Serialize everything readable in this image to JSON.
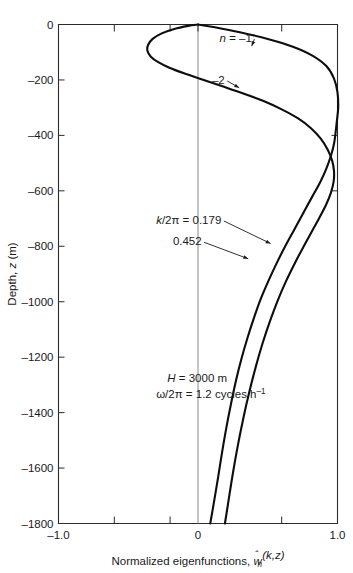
{
  "figure": {
    "background_color": "#ffffff",
    "curve_color": "#0d0d0d",
    "axis_color": "#2b2b2b",
    "zero_line_color": "#8a8a8a"
  },
  "chart_data": {
    "type": "line",
    "title": "",
    "xlabel": "Normalized eigenfunctions, ŵₙ(k,z)",
    "ylabel": "Depth, z (m)",
    "xlim": [
      -1.0,
      1.0
    ],
    "ylim": [
      -1800,
      0
    ],
    "grid": false,
    "legend_position": "inline-annotations",
    "xticks": [
      -1.0,
      -0.6,
      -0.2,
      0,
      0.6,
      1.0
    ],
    "xtick_labels": [
      "-1.0",
      "",
      "",
      "0",
      "",
      "1.0"
    ],
    "yticks": [
      0,
      -200,
      -400,
      -600,
      -800,
      -1000,
      -1200,
      -1400,
      -1600,
      -1800
    ],
    "ytick_labels": [
      "0",
      "-200",
      "-400",
      "-600",
      "-800",
      "-1000",
      "-1200",
      "-1400",
      "-1600",
      "-1800"
    ],
    "series": [
      {
        "name": "n = -1",
        "label": "n = -1",
        "label_italic_part": "n",
        "k_over_2pi": 0.179,
        "points": [
          [
            0.0,
            0
          ],
          [
            0.12,
            -10
          ],
          [
            0.3,
            -28
          ],
          [
            0.5,
            -52
          ],
          [
            0.68,
            -80
          ],
          [
            0.82,
            -112
          ],
          [
            0.92,
            -150
          ],
          [
            0.975,
            -195
          ],
          [
            1.0,
            -245
          ],
          [
            1.005,
            -300
          ],
          [
            0.995,
            -350
          ],
          [
            0.985,
            -395
          ],
          [
            0.975,
            -430
          ],
          [
            0.955,
            -470
          ],
          [
            0.92,
            -520
          ],
          [
            0.875,
            -570
          ],
          [
            0.82,
            -620
          ],
          [
            0.755,
            -680
          ],
          [
            0.69,
            -740
          ],
          [
            0.625,
            -800
          ],
          [
            0.565,
            -860
          ],
          [
            0.505,
            -925
          ],
          [
            0.45,
            -990
          ],
          [
            0.4,
            -1060
          ],
          [
            0.355,
            -1130
          ],
          [
            0.312,
            -1205
          ],
          [
            0.272,
            -1285
          ],
          [
            0.236,
            -1370
          ],
          [
            0.203,
            -1455
          ],
          [
            0.172,
            -1545
          ],
          [
            0.142,
            -1640
          ],
          [
            0.112,
            -1730
          ],
          [
            0.088,
            -1800
          ]
        ]
      },
      {
        "name": "n = -2",
        "label": "-2",
        "k_over_2pi": 0.452,
        "points": [
          [
            0.0,
            0
          ],
          [
            -0.07,
            -5
          ],
          [
            -0.17,
            -16
          ],
          [
            -0.26,
            -32
          ],
          [
            -0.325,
            -52
          ],
          [
            -0.358,
            -74
          ],
          [
            -0.362,
            -96
          ],
          [
            -0.338,
            -116
          ],
          [
            -0.285,
            -136
          ],
          [
            -0.205,
            -156
          ],
          [
            -0.1,
            -176
          ],
          [
            0.03,
            -198
          ],
          [
            0.17,
            -222
          ],
          [
            0.32,
            -248
          ],
          [
            0.47,
            -276
          ],
          [
            0.6,
            -306
          ],
          [
            0.715,
            -338
          ],
          [
            0.81,
            -374
          ],
          [
            0.88,
            -412
          ],
          [
            0.93,
            -452
          ],
          [
            0.962,
            -492
          ],
          [
            0.975,
            -530
          ],
          [
            0.972,
            -568
          ],
          [
            0.952,
            -608
          ],
          [
            0.918,
            -650
          ],
          [
            0.872,
            -695
          ],
          [
            0.818,
            -745
          ],
          [
            0.758,
            -800
          ],
          [
            0.695,
            -860
          ],
          [
            0.632,
            -925
          ],
          [
            0.572,
            -995
          ],
          [
            0.516,
            -1070
          ],
          [
            0.463,
            -1150
          ],
          [
            0.414,
            -1235
          ],
          [
            0.368,
            -1325
          ],
          [
            0.325,
            -1420
          ],
          [
            0.285,
            -1520
          ],
          [
            0.248,
            -1625
          ],
          [
            0.215,
            -1730
          ],
          [
            0.193,
            -1800
          ]
        ]
      }
    ],
    "annotations": [
      {
        "id": "n-minus-1",
        "text": "n = -1",
        "x": 0.155,
        "y": -62,
        "arrow_to": [
          0.385,
          -78
        ]
      },
      {
        "id": "n-minus-2",
        "text": "-2",
        "x": 0.1,
        "y": -213,
        "arrow_to": [
          0.295,
          -228
        ]
      },
      {
        "id": "k-0179",
        "text": "k/2π = 0.179",
        "x": -0.3,
        "y": -718,
        "arrow_to": [
          0.52,
          -790
        ]
      },
      {
        "id": "k-0452",
        "text": "0.452",
        "x": -0.18,
        "y": -795,
        "arrow_to": [
          0.36,
          -845
        ]
      },
      {
        "id": "param-H",
        "text": "H = 3000 m",
        "x": -0.22,
        "y": -1290
      },
      {
        "id": "param-omega",
        "text": "ω/2π = 1.2 cycles h⁻¹",
        "x": -0.3,
        "y": -1348
      }
    ]
  },
  "labels": {
    "x_axis_title": "Normalized eigenfunctions,",
    "x_axis_symbol_w": "w",
    "x_axis_symbol_sub": "n",
    "x_axis_symbol_args": "(k,z)",
    "y_axis_title_pre": "Depth, ",
    "y_axis_title_italic": "z",
    "y_axis_title_post": " (m)",
    "x_min": "-1.0",
    "x_zero": "0",
    "x_max": "1.0",
    "annot_n1_italic": "n",
    "annot_n1_rest": " = –1",
    "annot_n2": "–2",
    "annot_k_italic": "k",
    "annot_k_rest": "/2π = 0.179",
    "annot_k2": "0.452",
    "annot_H_italic": "H",
    "annot_H_rest": " = 3000 m",
    "annot_omega": "ω/2π = 1.2 cycles h",
    "annot_omega_sup": "–1"
  }
}
